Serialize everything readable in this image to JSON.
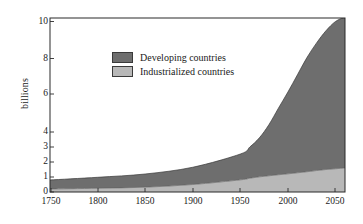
{
  "chart_data": {
    "type": "area",
    "title": "",
    "xlabel": "",
    "ylabel": "billions",
    "stacked": true,
    "grid": false,
    "legend_position": "upper-left-inside",
    "xlim": [
      1750,
      2060
    ],
    "ylim": [
      0,
      10.4
    ],
    "x_ticks": [
      1750,
      1800,
      1850,
      1900,
      1950,
      2000,
      2050
    ],
    "y_ticks": [
      0,
      1,
      2,
      3,
      4,
      6,
      8,
      10
    ],
    "y_axis_note": "non-linear (broken) scale: 0-4 compressed relative to 4-10",
    "x": [
      1750,
      1800,
      1850,
      1900,
      1950,
      1960,
      1970,
      1980,
      1990,
      2000,
      2010,
      2020,
      2030,
      2040,
      2050,
      2060
    ],
    "series": [
      {
        "name": "Industrialized countries",
        "color": "#b8b8b8",
        "values": [
          0.2,
          0.25,
          0.32,
          0.5,
          0.81,
          0.92,
          1.01,
          1.08,
          1.15,
          1.21,
          1.28,
          1.35,
          1.43,
          1.5,
          1.55,
          1.6
        ]
      },
      {
        "name": "Developing countries",
        "color": "#6e6e6e",
        "values": [
          0.6,
          0.73,
          0.88,
          1.15,
          1.72,
          2.08,
          2.6,
          3.3,
          4.1,
          4.9,
          5.8,
          6.7,
          7.4,
          8.0,
          8.45,
          8.65
        ]
      }
    ],
    "totals": [
      0.8,
      0.98,
      1.2,
      1.65,
      2.53,
      3.0,
      3.61,
      4.38,
      5.25,
      6.11,
      7.08,
      8.05,
      8.83,
      9.5,
      10.0,
      10.25
    ]
  },
  "legend": {
    "items": [
      {
        "label": "Developing countries",
        "color": "#6e6e6e"
      },
      {
        "label": "Industrialized countries",
        "color": "#b8b8b8"
      }
    ]
  },
  "axes": {
    "y_label": "billions",
    "y_tick_labels": [
      "10",
      "8",
      "6",
      "4",
      "3",
      "2",
      "1",
      "0"
    ],
    "x_tick_labels": [
      "1750",
      "1800",
      "1850",
      "1900",
      "1950",
      "2000",
      "2050"
    ]
  },
  "colors": {
    "developing": "#6e6e6e",
    "industrialized": "#b8b8b8",
    "axis": "#2b2b2b",
    "background": "#ffffff"
  }
}
